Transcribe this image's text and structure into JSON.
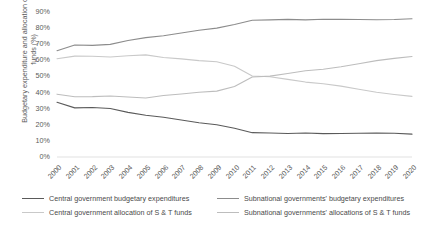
{
  "axes": {
    "ylabel": "Budgetary expenditure and allocation of S & T funds (%)",
    "yticks": [
      "90%",
      "80%",
      "70%",
      "60%",
      "50%",
      "40%",
      "30%",
      "20%",
      "10%",
      "0%"
    ],
    "xticks": [
      "2000",
      "2001",
      "2002",
      "2003",
      "2004",
      "2005",
      "2006",
      "2007",
      "2008",
      "2009",
      "2010",
      "2011",
      "2012",
      "2013",
      "2014",
      "2015",
      "2016",
      "2017",
      "2018",
      "2019",
      "2020"
    ]
  },
  "legend": {
    "items": [
      {
        "label": "Central government budgetary expenditures",
        "color": "#5a5a5a"
      },
      {
        "label": "Central government allocation of S & T funds",
        "color": "#c9c9c9"
      },
      {
        "label": "Subnational governments' budgetary expenditures",
        "color": "#8c8c8c"
      },
      {
        "label": "Subnational governments' allocations of S & T funds",
        "color": "#bdbdbd"
      }
    ]
  },
  "chart_data": {
    "type": "line",
    "title": "",
    "xlabel": "",
    "ylabel": "Budgetary expenditure and allocation of S & T funds (%)",
    "ylim": [
      0,
      90
    ],
    "ytick_step": 10,
    "grid": false,
    "legend_position": "bottom",
    "x": [
      "2000",
      "2001",
      "2002",
      "2003",
      "2004",
      "2005",
      "2006",
      "2007",
      "2008",
      "2009",
      "2010",
      "2011",
      "2012",
      "2013",
      "2014",
      "2015",
      "2016",
      "2017",
      "2018",
      "2019",
      "2020"
    ],
    "series": [
      {
        "name": "Central government budgetary expenditures",
        "color": "#5a5a5a",
        "values": [
          34.0,
          30.5,
          30.7,
          30.1,
          27.7,
          25.9,
          24.7,
          23.0,
          21.3,
          20.0,
          17.8,
          15.1,
          14.9,
          14.6,
          14.9,
          14.5,
          14.6,
          14.7,
          14.8,
          14.7,
          14.2
        ]
      },
      {
        "name": "Central government allocation of S & T funds",
        "color": "#c9c9c9",
        "values": [
          61.0,
          62.6,
          62.5,
          62.1,
          62.8,
          63.4,
          61.8,
          60.9,
          59.8,
          59.1,
          56.3,
          50.3,
          49.8,
          48.2,
          46.5,
          45.5,
          44.0,
          42.1,
          40.2,
          38.8,
          37.6
        ]
      },
      {
        "name": "Subnational governments' budgetary expenditures",
        "color": "#8c8c8c",
        "values": [
          66.0,
          69.5,
          69.3,
          69.9,
          72.3,
          74.1,
          75.3,
          77.0,
          78.7,
          80.0,
          82.2,
          84.9,
          85.1,
          85.4,
          85.1,
          85.5,
          85.4,
          85.3,
          85.2,
          85.3,
          85.8
        ]
      },
      {
        "name": "Subnational governments' allocations of S & T funds",
        "color": "#bdbdbd",
        "values": [
          39.0,
          37.4,
          37.5,
          37.9,
          37.2,
          36.6,
          38.2,
          39.1,
          40.2,
          40.9,
          43.7,
          49.7,
          50.2,
          51.8,
          53.5,
          54.5,
          56.0,
          57.9,
          59.8,
          61.2,
          62.4
        ]
      }
    ]
  }
}
